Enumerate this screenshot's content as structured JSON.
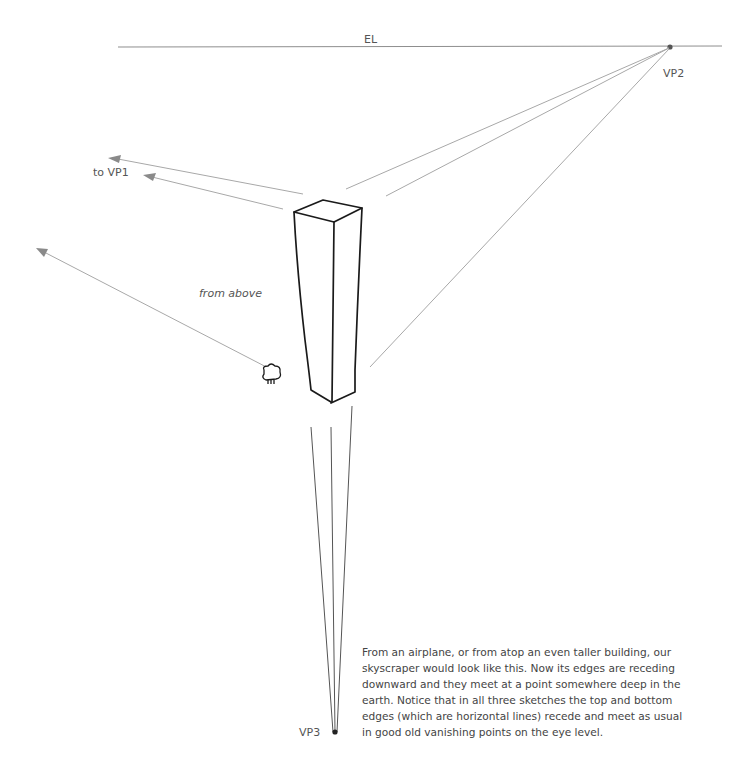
{
  "labels": {
    "eye_level": "EL",
    "vp2": "VP2",
    "vp3": "VP3",
    "to_vp1": "to VP1",
    "from_above": "from above"
  },
  "caption": {
    "lines": [
      "From an airplane, or from atop an even taller building, our",
      "skyscraper would look like this. Now its edges are receding",
      "downward and they meet at a point somewhere deep in the",
      "earth. Notice that in all three sketches the top and bottom",
      "edges (which are horizontal lines) recede and meet as usual",
      "in good old vanishing points on the eye level."
    ]
  },
  "colors": {
    "construction_line": "#9a9a9a",
    "ink": "#1a1a1a",
    "text": "#555555"
  }
}
